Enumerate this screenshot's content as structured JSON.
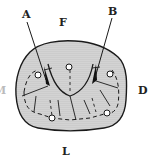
{
  "figure": {
    "type": "dental occlusal surface diagram",
    "labels": {
      "A": "A",
      "B": "B",
      "F": "F",
      "D": "D",
      "L": "L",
      "M_partial": "M"
    },
    "colors": {
      "outline": "#1a1a1a",
      "stipple_fill": "#c8c8c8",
      "background": "#ffffff"
    }
  }
}
